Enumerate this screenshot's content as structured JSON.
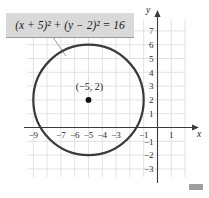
{
  "figure": {
    "equation": "(x + 5)² + (y − 2)² = 16",
    "center_label": "(−5, 2)",
    "axis_x_label": "x",
    "axis_y_label": "y",
    "marker_name": "page-marker"
  },
  "chart_data": {
    "type": "scatter",
    "title": "",
    "subtitle": "",
    "xlabel": "x",
    "ylabel": "y",
    "xlim": [
      -10.2,
      2.1
    ],
    "ylim": [
      -3.8,
      8.2
    ],
    "grid": true,
    "grid_step": 1,
    "legend": "none",
    "annotations": [
      {
        "name": "equation-callout",
        "text": "(x + 5)² + (y − 2)² = 16",
        "points_to": [
          -7.3,
          5.6
        ]
      },
      {
        "name": "center-point-label",
        "text": "(−5, 2)",
        "at": [
          -5,
          2.75
        ]
      }
    ],
    "series": [
      {
        "name": "circle",
        "type": "circle",
        "center": [
          -5,
          2
        ],
        "radius": 4,
        "color": "#3a3a3a",
        "linewidth": 2.2
      },
      {
        "name": "center-point",
        "type": "scatter",
        "x": [
          -5
        ],
        "y": [
          2
        ],
        "color": "#111111",
        "marker": "o"
      }
    ],
    "xticks": [
      -9,
      -7,
      -6,
      -5,
      -4,
      -3,
      -1,
      1
    ],
    "xtick_labels": [
      "−9",
      "−7",
      "−6",
      "−5",
      "−4",
      "−3",
      "−1",
      "1"
    ],
    "yticks": [
      7,
      6,
      5,
      4,
      3,
      2,
      1,
      -1,
      -2,
      -3
    ],
    "ytick_labels": [
      "7",
      "6",
      "5",
      "4",
      "3",
      "2",
      "1",
      "−1",
      "−2",
      "−3"
    ]
  },
  "colors": {
    "grid": "#e2e2e6",
    "axis": "#3a3a3a",
    "curve": "#3a3a3a",
    "callout_bg": "#d9d9d9",
    "marker": "#9e9e9e"
  }
}
